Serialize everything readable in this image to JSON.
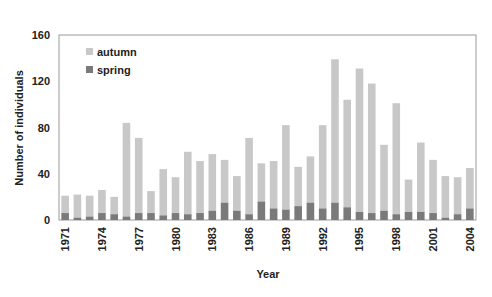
{
  "chart_data": {
    "type": "bar",
    "stacked": true,
    "title": "",
    "xlabel": "Year",
    "ylabel": "Number of individuals",
    "ylim": [
      0,
      160
    ],
    "yticks": [
      0,
      40,
      80,
      120,
      160
    ],
    "grid": false,
    "legend_position": "upper-left-inside",
    "categories": [
      1971,
      1972,
      1973,
      1974,
      1975,
      1976,
      1977,
      1978,
      1979,
      1980,
      1981,
      1982,
      1983,
      1984,
      1985,
      1986,
      1987,
      1988,
      1989,
      1990,
      1991,
      1992,
      1993,
      1994,
      1995,
      1996,
      1997,
      1998,
      1999,
      2000,
      2001,
      2002,
      2003,
      2004
    ],
    "xtick_labels": [
      "1971",
      "1974",
      "1977",
      "1980",
      "1983",
      "1986",
      "1989",
      "1992",
      "1995",
      "1998",
      "2001",
      "2004"
    ],
    "series": [
      {
        "name": "spring",
        "color": "#7a7a7a",
        "values": [
          6,
          2,
          3,
          6,
          5,
          3,
          6,
          6,
          4,
          6,
          5,
          6,
          8,
          15,
          8,
          5,
          16,
          10,
          9,
          12,
          15,
          10,
          15,
          11,
          7,
          6,
          8,
          5,
          7,
          7,
          6,
          2,
          5,
          10
        ]
      },
      {
        "name": "autumn",
        "color": "#c8c8c8",
        "values": [
          15,
          20,
          18,
          20,
          15,
          81,
          65,
          19,
          40,
          31,
          54,
          45,
          49,
          37,
          30,
          66,
          33,
          41,
          73,
          34,
          40,
          72,
          124,
          93,
          124,
          112,
          57,
          96,
          28,
          60,
          46,
          36,
          32,
          35
        ]
      }
    ],
    "totals": [
      21,
      22,
      21,
      26,
      20,
      84,
      71,
      25,
      44,
      37,
      59,
      51,
      57,
      52,
      38,
      71,
      49,
      51,
      82,
      46,
      55,
      82,
      139,
      104,
      131,
      118,
      65,
      101,
      35,
      67,
      52,
      38,
      37,
      45
    ]
  },
  "legend": {
    "items": [
      {
        "label": "autumn",
        "color": "#c8c8c8"
      },
      {
        "label": "spring",
        "color": "#7a7a7a"
      }
    ]
  }
}
